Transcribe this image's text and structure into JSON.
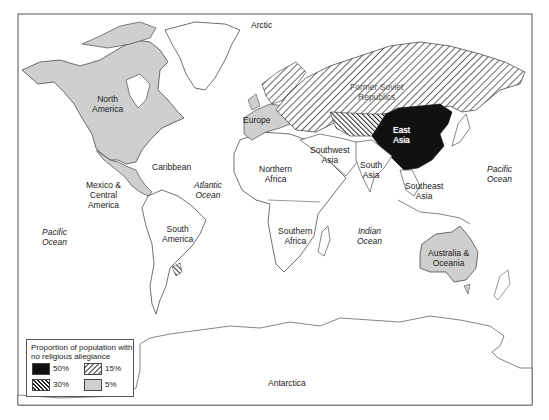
{
  "map": {
    "title": "",
    "regions": [
      {
        "name": "North America",
        "label": "North\nAmerica",
        "category": "5%"
      },
      {
        "name": "Europe",
        "label": "Europe",
        "category": "5%"
      },
      {
        "name": "Former Soviet Republics",
        "label": "Former Soviet\nRepublics",
        "category": "15%"
      },
      {
        "name": "East Asia",
        "label": "East\nAsia",
        "category": "50%"
      },
      {
        "name": "Central Asia",
        "label": "",
        "category": "30%"
      },
      {
        "name": "Caribbean",
        "label": "Caribbean",
        "category": "none"
      },
      {
        "name": "Mexico & Central America",
        "label": "Mexico &\nCentral\nAmerica",
        "category": "none"
      },
      {
        "name": "South America",
        "label": "South\nAmerica",
        "category": "none"
      },
      {
        "name": "Uruguay",
        "label": "",
        "category": "30%"
      },
      {
        "name": "Northern Africa",
        "label": "Northern\nAfrica",
        "category": "none"
      },
      {
        "name": "Southern Africa",
        "label": "Southern\nAfrica",
        "category": "none"
      },
      {
        "name": "Southwest Asia",
        "label": "Southwest\nAsia",
        "category": "none"
      },
      {
        "name": "South Asia",
        "label": "South\nAsia",
        "category": "none"
      },
      {
        "name": "Southeast Asia",
        "label": "Southeast\nAsia",
        "category": "none"
      },
      {
        "name": "Australia & Oceania",
        "label": "Australia &\nOceania",
        "category": "5%"
      },
      {
        "name": "Antarctica",
        "label": "Antarctica",
        "category": "none"
      }
    ],
    "oceans": {
      "arctic": "Arctic",
      "atlantic": "Atlantic\nOcean",
      "pacific_west": "Pacific\nOcean",
      "pacific_east": "Pacific\nOcean",
      "indian": "Indian\nOcean"
    }
  },
  "legend": {
    "title": "Proportion of population with\nno religious allegiance",
    "items": [
      {
        "label": "50%",
        "style": "solid-black"
      },
      {
        "label": "15%",
        "style": "light-hatch"
      },
      {
        "label": "30%",
        "style": "dark-hatch"
      },
      {
        "label": "5%",
        "style": "light-gray"
      }
    ]
  },
  "colors": {
    "black": "#111111",
    "gray": "#cfcfcf",
    "outline": "#333333",
    "frame": "#555555"
  }
}
